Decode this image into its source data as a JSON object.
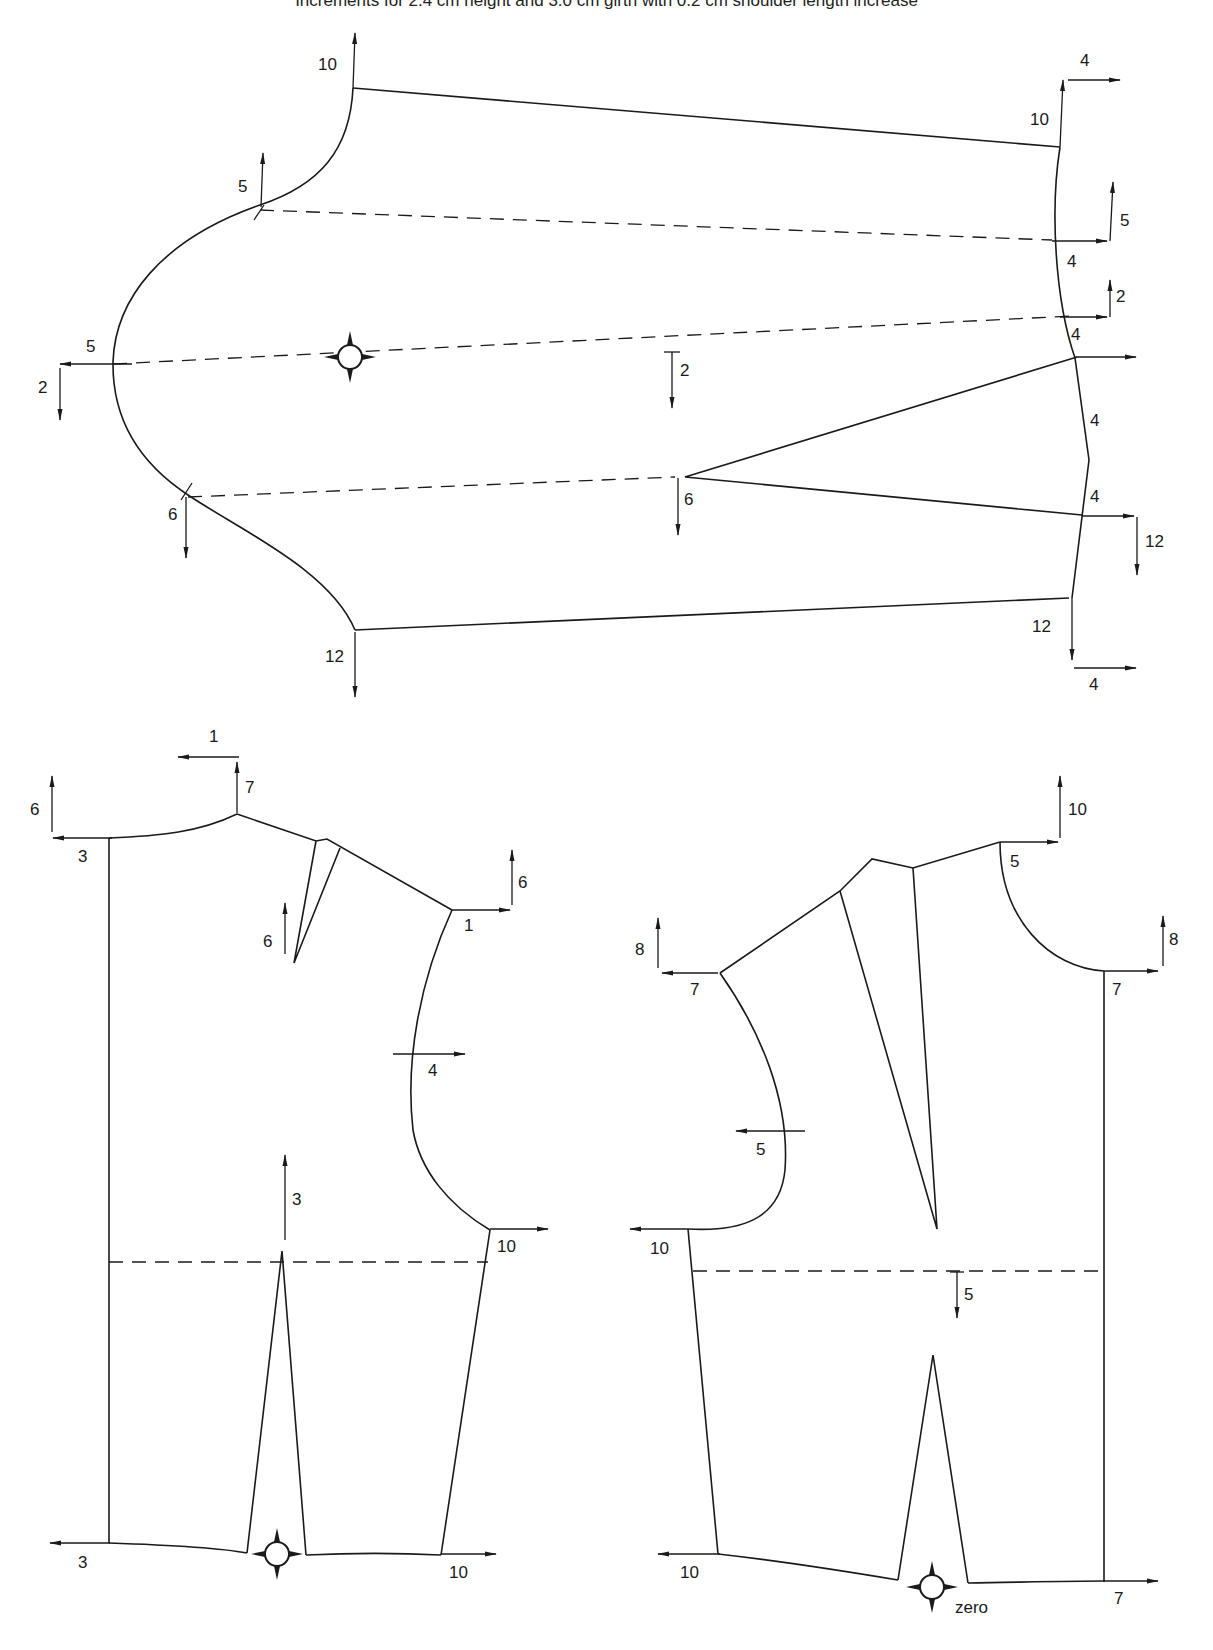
{
  "title": "Increments for 2.4 cm height and 3.0 cm girth with 0.2 cm shoulder length increase",
  "colors": {
    "ink": "#1a1a1a",
    "background": "#ffffff"
  },
  "sleeve": {
    "labels": {
      "cap_top": "10",
      "cap_front_notch": "5",
      "underarm_left_h": "5",
      "underarm_left_v": "2",
      "center_line": "2",
      "elbow_dart": "6",
      "back_notch": "6",
      "underarm_bottom": "12",
      "wrist_top_v": "10",
      "wrist_top_h": "4",
      "wrist_r1_h": "4",
      "wrist_r1_v": "5",
      "wrist_r2_h": "4",
      "wrist_r2_v": "2",
      "wrist_r3_h": "4",
      "wrist_r4_h": "4",
      "wrist_r4_v": "12",
      "wrist_bottom_v": "12",
      "wrist_bottom_h": "4"
    }
  },
  "back_bodice": {
    "labels": {
      "neck_cb_v": "6",
      "neck_cb_h": "3",
      "neck_point_h": "1",
      "neck_point_v": "7",
      "shoulder_dart": "6",
      "shoulder_tip_v": "6",
      "shoulder_tip_h": "1",
      "armhole_mid": "4",
      "waist_dart": "3",
      "underarm": "10",
      "hem_cb": "3",
      "hem_side": "10"
    }
  },
  "front_bodice": {
    "labels": {
      "neck_point_v": "10",
      "neck_point_h": "5",
      "cf_neck_v": "8",
      "cf_neck_h": "7",
      "shoulder_tip_v": "8",
      "shoulder_tip_h": "7",
      "armhole_mid": "5",
      "underarm": "10",
      "waist_dart": "5",
      "hem_side": "10",
      "hem_cf": "7",
      "zero_point": "zero"
    }
  }
}
